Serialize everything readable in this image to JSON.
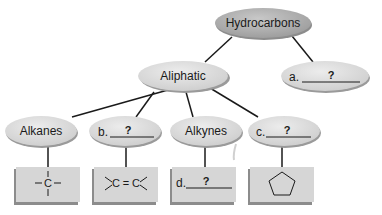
{
  "diagram": {
    "nodes": {
      "root": {
        "label": "Hydrocarbons"
      },
      "aliphatic": {
        "label": "Aliphatic"
      },
      "a": {
        "prefix": "a.",
        "blank": "?"
      },
      "alkanes": {
        "label": "Alkanes"
      },
      "b": {
        "prefix": "b.",
        "blank": "?"
      },
      "alkynes": {
        "label": "Alkynes"
      },
      "c": {
        "prefix": "c.",
        "blank": "?"
      }
    },
    "boxes": {
      "alkanes_structure": {
        "atom": "C",
        "name": "single-bond-carbon"
      },
      "b_structure": {
        "left_atom": "C",
        "bond": "=",
        "right_atom": "C",
        "name": "double-bond"
      },
      "d": {
        "prefix": "d.",
        "blank": "?"
      },
      "c_structure": {
        "name": "cyclopentane-ring"
      }
    },
    "colors": {
      "ellipse_fill": "#d9d9d9",
      "ellipse_root_fill": "#b3b3b3",
      "box_fill": "#d6d6d6",
      "shadow": "#8c8c8c",
      "line": "#1a1a1a"
    }
  }
}
